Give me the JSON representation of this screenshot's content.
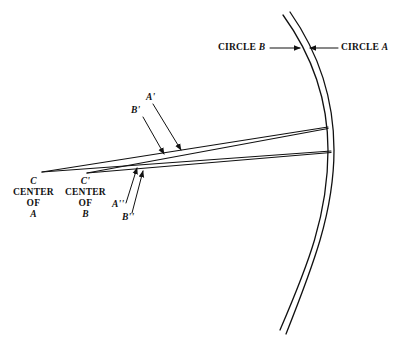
{
  "figure": {
    "type": "geometric-diagram"
  },
  "labels": {
    "circle_b": {
      "text": "CIRCLE",
      "letter": "B"
    },
    "circle_a": {
      "text": "CIRCLE",
      "letter": "A"
    },
    "a_prime": "A'",
    "b_prime": "B'",
    "a_double_prime": "A''",
    "b_double_prime": "B''",
    "center_a": {
      "point": "C",
      "line1": "CENTER",
      "line2": "OF",
      "line3": "A"
    },
    "center_b": {
      "point": "C'",
      "line1": "CENTER",
      "line2": "OF",
      "line3": "B"
    }
  },
  "colors": {
    "ink": "#111111",
    "background": "#ffffff"
  }
}
